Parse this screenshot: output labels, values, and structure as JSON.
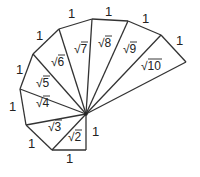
{
  "diagram": {
    "center": [
      86,
      114
    ],
    "vertices": [
      [
        86,
        150
      ],
      [
        52,
        150
      ],
      [
        26,
        125
      ],
      [
        20,
        89
      ],
      [
        33,
        54
      ],
      [
        59,
        29
      ],
      [
        92,
        19
      ],
      [
        128,
        21
      ],
      [
        161,
        35
      ],
      [
        186,
        62
      ]
    ],
    "unit_labels": [
      {
        "text": "1",
        "x": 92,
        "y": 136
      },
      {
        "text": "1",
        "x": 66,
        "y": 163
      },
      {
        "text": "1",
        "x": 28,
        "y": 148
      },
      {
        "text": "1",
        "x": 9,
        "y": 111
      },
      {
        "text": "1",
        "x": 16,
        "y": 74
      },
      {
        "text": "1",
        "x": 36,
        "y": 40
      },
      {
        "text": "1",
        "x": 68,
        "y": 18
      },
      {
        "text": "1",
        "x": 105,
        "y": 16
      },
      {
        "text": "1",
        "x": 142,
        "y": 23
      },
      {
        "text": "1",
        "x": 176,
        "y": 45
      }
    ],
    "radical_labels": [
      {
        "n": "2",
        "x": 68,
        "y": 141
      },
      {
        "n": "3",
        "x": 48,
        "y": 131
      },
      {
        "n": "4",
        "x": 36,
        "y": 107
      },
      {
        "n": "5",
        "x": 36,
        "y": 87
      },
      {
        "n": "6",
        "x": 51,
        "y": 66
      },
      {
        "n": "7",
        "x": 74,
        "y": 53
      },
      {
        "n": "8",
        "x": 98,
        "y": 47
      },
      {
        "n": "9",
        "x": 123,
        "y": 53
      },
      {
        "n": "10",
        "x": 141,
        "y": 70
      }
    ]
  }
}
